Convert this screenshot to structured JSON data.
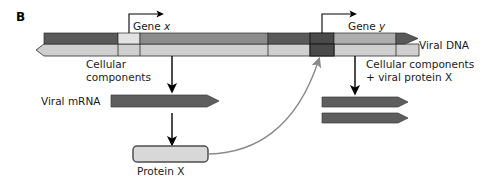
{
  "panel": {
    "letter": "B"
  },
  "diagram": {
    "type": "biology-pathway-diagram",
    "title_labels": {
      "gene_x": "Gene",
      "gene_x_italic": "x",
      "gene_y": "Gene",
      "gene_y_italic": "y",
      "viral_dna": "Viral DNA",
      "viral_mrna": "Viral mRNA",
      "protein_x": "Protein X",
      "cellular_components_left": "Cellular\ncomponents",
      "cellular_components_right": "Cellular components\n+ viral protein X"
    },
    "colors": {
      "dark_strand": "#595959",
      "mid_strand": "#8c8c8c",
      "light_strand": "#cfcfcf",
      "pale_segment": "#e2e2e2",
      "operator_dark": "#4a4a4a",
      "mrna_fill": "#5e5e5e",
      "protein_fill": "#d8d8d8",
      "protein_border": "#4d4d4d",
      "arrow_black": "#000000",
      "arrow_gray": "#8a8a8a",
      "outline": "#2b2b2b",
      "text": "#1a1a1a",
      "background": "#ffffff"
    },
    "dna_strand": {
      "name": "viral-dna-duplex",
      "left_end": "arrowhead-pointed-left",
      "right_end": "arrowhead-pointed-right",
      "segments_top": [
        {
          "name": "upstream-dark",
          "shade": "dark"
        },
        {
          "name": "promoter-x-pale",
          "shade": "pale"
        },
        {
          "name": "gene-x-body",
          "shade": "mid"
        },
        {
          "name": "spacer-dark",
          "shade": "dark"
        },
        {
          "name": "operator-y",
          "shade": "operator"
        },
        {
          "name": "gene-y-body",
          "shade": "mid"
        },
        {
          "name": "downstream-tip",
          "shade": "dark"
        }
      ],
      "bottom_strand_shade": "light"
    },
    "transcription_arrows": [
      {
        "name": "transcription-start-gene-x"
      },
      {
        "name": "transcription-start-gene-y"
      }
    ],
    "flow_arrows": [
      {
        "name": "translation-arrow-left-top",
        "label": "Cellular components"
      },
      {
        "name": "translation-arrow-left-bottom"
      },
      {
        "name": "translation-arrow-right",
        "label": "Cellular components + viral protein X"
      }
    ],
    "mrna_transcripts": [
      {
        "name": "viral-mrna-primary",
        "labelled": true
      },
      {
        "name": "viral-mrna-secondary-1",
        "labelled": false
      },
      {
        "name": "viral-mrna-secondary-2",
        "labelled": false
      }
    ],
    "regulation": {
      "name": "protein-x-feedback-arrow",
      "from": "Protein X",
      "to": "operator-y",
      "style": "curved-gray-arrow"
    }
  }
}
